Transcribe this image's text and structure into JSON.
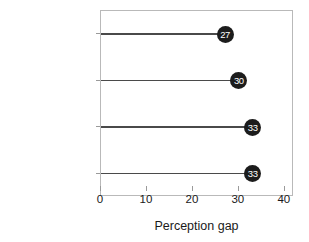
{
  "chart_data": {
    "type": "bar",
    "subtype": "lollipop-horizontal",
    "title": "",
    "subtitle": "",
    "xlabel": "Perception gap",
    "ylabel": "",
    "orientation": "horizontal",
    "categories": [
      "Did not vote",
      "Someone else",
      "Trump",
      "Biden"
    ],
    "values": [
      27,
      30,
      33,
      33
    ],
    "point_labels": [
      "27",
      "30",
      "33",
      "33"
    ],
    "xlim": [
      0,
      42
    ],
    "xticks": [
      0,
      10,
      20,
      30,
      40
    ],
    "xtick_labels": [
      "0",
      "10",
      "20",
      "30",
      "40"
    ],
    "grid": false,
    "legend": false,
    "legend_position": "none",
    "colors": {
      "marker": "#1c1c1c",
      "marker_label": "#ffffff",
      "stem": "#4a4a4a",
      "frame": "#b9b9b9",
      "text": "#1a1a1a",
      "background": "#ffffff"
    }
  }
}
